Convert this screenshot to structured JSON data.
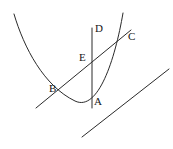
{
  "figure": {
    "kind": "geometry-diagram",
    "canvas": {
      "width": 173,
      "height": 149,
      "background": "#ffffff"
    },
    "stroke_color": "#2a2a2a",
    "label_color": "#161616",
    "labels": [
      {
        "id": "A",
        "text": "A",
        "x": 94,
        "y": 96
      },
      {
        "id": "B",
        "text": "B",
        "x": 49,
        "y": 83
      },
      {
        "id": "C",
        "text": "C",
        "x": 128,
        "y": 31
      },
      {
        "id": "D",
        "text": "D",
        "x": 95,
        "y": 23
      },
      {
        "id": "E",
        "text": "E",
        "x": 79,
        "y": 52
      }
    ],
    "shapes": [
      {
        "id": "parabola",
        "name": "parabola-curve",
        "type": "curve",
        "path": "M 14,14 C 24,48 44,86 75,101 C 98,112 115,60 123,13"
      },
      {
        "id": "secant",
        "name": "secant-line-bc",
        "type": "line",
        "x1": 36,
        "y1": 108,
        "x2": 131,
        "y2": 30
      },
      {
        "id": "vertical",
        "name": "vertical-line-ad",
        "type": "line",
        "x1": 92,
        "y1": 28,
        "x2": 92,
        "y2": 108
      },
      {
        "id": "parallel",
        "name": "parallel-line-segment",
        "type": "line",
        "x1": 82,
        "y1": 137,
        "x2": 169,
        "y2": 69
      }
    ]
  }
}
